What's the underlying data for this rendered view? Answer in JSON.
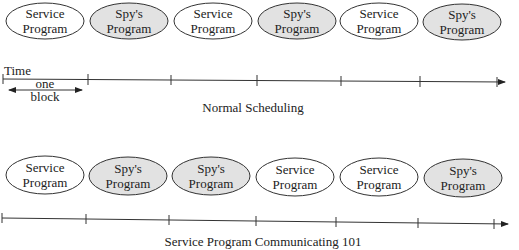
{
  "top_row": {
    "caption": "Normal Scheduling",
    "time_label": "Time",
    "block_label_line1": "one",
    "block_label_line2": "block",
    "blocks": [
      {
        "type": "service",
        "line1": "Service",
        "line2": "Program"
      },
      {
        "type": "spy",
        "line1": "Spy's",
        "line2": "Program"
      },
      {
        "type": "service",
        "line1": "Service",
        "line2": "Program"
      },
      {
        "type": "spy",
        "line1": "Spy's",
        "line2": "Program"
      },
      {
        "type": "service",
        "line1": "Service",
        "line2": "Program"
      },
      {
        "type": "spy",
        "line1": "Spy's",
        "line2": "Program"
      }
    ]
  },
  "bottom_row": {
    "caption": "Service Program Communicating 101",
    "blocks": [
      {
        "type": "service",
        "line1": "Service",
        "line2": "Program"
      },
      {
        "type": "spy",
        "line1": "Spy's",
        "line2": "Program"
      },
      {
        "type": "spy",
        "line1": "Spy's",
        "line2": "Program"
      },
      {
        "type": "service",
        "line1": "Service",
        "line2": "Program"
      },
      {
        "type": "service",
        "line1": "Service",
        "line2": "Program"
      },
      {
        "type": "spy",
        "line1": "Spy's",
        "line2": "Program"
      }
    ]
  },
  "colors": {
    "service_fill": "#ffffff",
    "spy_fill": "#e2e2e2",
    "stroke": "#333333"
  }
}
